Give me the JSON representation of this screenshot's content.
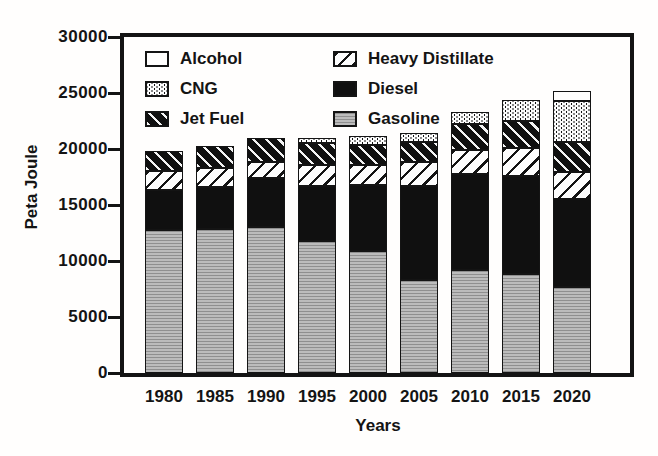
{
  "figure": {
    "paper_color": "#fffefd",
    "ink_color": "#141414",
    "gasoline_gray": "#bcbcbc"
  },
  "axes": {
    "y_label": "Peta Joule",
    "x_label": "Years"
  },
  "legend": {
    "items": [
      {
        "label": "Alcohol",
        "pattern": "alcohol"
      },
      {
        "label": "Heavy Distillate",
        "pattern": "heavy-distillate"
      },
      {
        "label": "CNG",
        "pattern": "cng"
      },
      {
        "label": "Diesel",
        "pattern": "diesel"
      },
      {
        "label": "Jet Fuel",
        "pattern": "jet-fuel"
      },
      {
        "label": "Gasoline",
        "pattern": "gasoline"
      }
    ]
  },
  "chart_data": {
    "type": "bar",
    "stacked": true,
    "title": "",
    "xlabel": "Years",
    "ylabel": "Peta Joule",
    "ylim": [
      0,
      30000
    ],
    "y_ticks": [
      0,
      5000,
      10000,
      15000,
      20000,
      25000,
      30000
    ],
    "grid": false,
    "legend_position": "top-left-inside",
    "categories": [
      "1980",
      "1985",
      "1990",
      "1995",
      "2000",
      "2005",
      "2010",
      "2015",
      "2020"
    ],
    "series": [
      {
        "name": "Gasoline",
        "pattern": "gasoline",
        "values": [
          12800,
          12900,
          13000,
          11800,
          10900,
          8300,
          9200,
          8850,
          7650
        ]
      },
      {
        "name": "Diesel",
        "pattern": "diesel",
        "values": [
          3500,
          3700,
          4400,
          4900,
          5900,
          8400,
          8600,
          8750,
          7850
        ]
      },
      {
        "name": "Heavy Distillate",
        "pattern": "heavy-distillate",
        "values": [
          1700,
          1700,
          1450,
          1900,
          1800,
          2100,
          2100,
          2450,
          2450
        ]
      },
      {
        "name": "Jet Fuel",
        "pattern": "jet-fuel",
        "values": [
          1800,
          2000,
          2150,
          1900,
          1750,
          1800,
          2350,
          2450,
          2650
        ]
      },
      {
        "name": "CNG",
        "pattern": "cng",
        "values": [
          0,
          0,
          0,
          500,
          850,
          800,
          1050,
          1850,
          3650
        ]
      },
      {
        "name": "Alcohol",
        "pattern": "alcohol",
        "values": [
          0,
          0,
          0,
          0,
          0,
          0,
          0,
          0,
          900
        ]
      }
    ]
  }
}
